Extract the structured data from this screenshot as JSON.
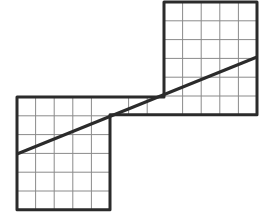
{
  "diagram": {
    "title": "",
    "colors": {
      "background": "#ffffff",
      "grid_line": "#8a8a8a",
      "outline": "#2b2b2b",
      "diagonal": "#2b2b2b"
    },
    "cell_size": 18.6,
    "shapes": [
      {
        "name": "lower-left-rect",
        "x": 17,
        "y": 97,
        "cols": 5,
        "rows": 6
      },
      {
        "name": "connector-strip",
        "x": 110,
        "y": 97,
        "cols": 3,
        "rows": 1
      },
      {
        "name": "upper-right-rect",
        "x": 164,
        "y": 2,
        "cols": 5,
        "rows": 6
      }
    ],
    "diagonal": {
      "x1": 17,
      "y1": 154,
      "x2": 257,
      "y2": 57
    }
  }
}
